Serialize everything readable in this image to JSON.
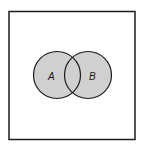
{
  "diagram": {
    "type": "venn",
    "sets": [
      {
        "label": "A",
        "fill": "#d0d0d0"
      },
      {
        "label": "B",
        "fill": "#d0d0d0"
      }
    ],
    "shaded_region": "A union B",
    "frame_color": "#1a1a1a",
    "background": "#ffffff"
  }
}
